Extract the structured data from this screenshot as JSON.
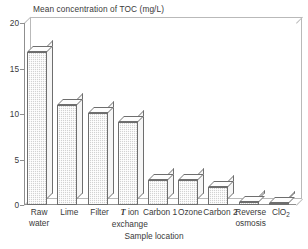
{
  "chart_data": {
    "type": "bar",
    "title": "Mean concentration of TOC (mg/L)",
    "xlabel": "Sample location",
    "ylabel": "",
    "ylim": [
      0,
      20
    ],
    "yticks": [
      0,
      5,
      10,
      15,
      20
    ],
    "grid": false,
    "legend": null,
    "style": "3d-shaded-bars",
    "categories": [
      "Raw water",
      "Lime",
      "Filter",
      "T ion exchange",
      "Carbon 1",
      "Ozone",
      "Carbon 2",
      "Reverse osmosis",
      "ClO2"
    ],
    "category_labels": [
      {
        "line1": "Raw",
        "line2": "water",
        "italic_first": false
      },
      {
        "line1": "Lime",
        "line2": "",
        "italic_first": false
      },
      {
        "line1": "Filter",
        "line2": "",
        "italic_first": false
      },
      {
        "line1": "ion",
        "line2": "exchange",
        "italic_first": true,
        "italic_char": "T"
      },
      {
        "line1": "Carbon 1",
        "line2": "",
        "italic_first": false
      },
      {
        "line1": "Ozone",
        "line2": "",
        "italic_first": false
      },
      {
        "line1": "Carbon 2",
        "line2": "",
        "italic_first": false
      },
      {
        "line1": "Reverse",
        "line2": "osmosis",
        "italic_first": false
      },
      {
        "line1": "ClO",
        "line2": "",
        "italic_first": false,
        "subscript": "2"
      }
    ],
    "values": [
      16.8,
      11.0,
      10.1,
      9.1,
      2.7,
      2.7,
      2.0,
      0.3,
      0.2
    ],
    "units": "mg/L"
  },
  "colors": {
    "bar_fill": "#d2d2d2",
    "bar_outline": "#6e6e6e",
    "bar_top": "#fdfdfd",
    "axis": "#8f8f8f",
    "frame": "#b9b9b9",
    "text": "#3a3a3a",
    "background": "#ffffff"
  }
}
